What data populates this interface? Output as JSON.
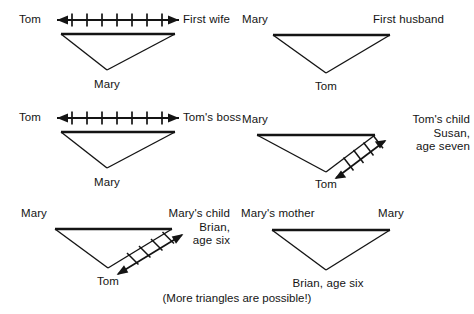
{
  "figure": {
    "caption": "(More triangles are possible!)",
    "stroke_color": "#141414",
    "background_color": "#ffffff"
  },
  "panels": [
    {
      "id": "panel-1",
      "top_left_label": "Tom",
      "top_right_label": "First wife",
      "apex_label": "Mary",
      "conflict_arrow": "horizontal",
      "tick_count": 7
    },
    {
      "id": "panel-2",
      "top_left_label": "Mary",
      "top_right_label": "First husband",
      "apex_label": "Tom",
      "conflict_arrow": "none",
      "tick_count": 0
    },
    {
      "id": "panel-3",
      "top_left_label": "Tom",
      "top_right_label": "Tom's boss",
      "apex_label": "Mary",
      "conflict_arrow": "horizontal",
      "tick_count": 7
    },
    {
      "id": "panel-4",
      "top_left_label": "Mary",
      "top_right_label": "Tom's child\nSusan,\nage seven",
      "apex_label": "Tom",
      "conflict_arrow": "diagonal",
      "tick_count": 4
    },
    {
      "id": "panel-5",
      "top_left_label": "Mary",
      "top_right_label": "Mary's child\nBrian,\nage six",
      "apex_label": "Tom",
      "conflict_arrow": "diagonal",
      "tick_count": 4
    },
    {
      "id": "panel-6",
      "top_left_label": "Mary's mother",
      "top_right_label": "Mary",
      "apex_label": "Brian, age six",
      "conflict_arrow": "none",
      "tick_count": 0
    }
  ]
}
